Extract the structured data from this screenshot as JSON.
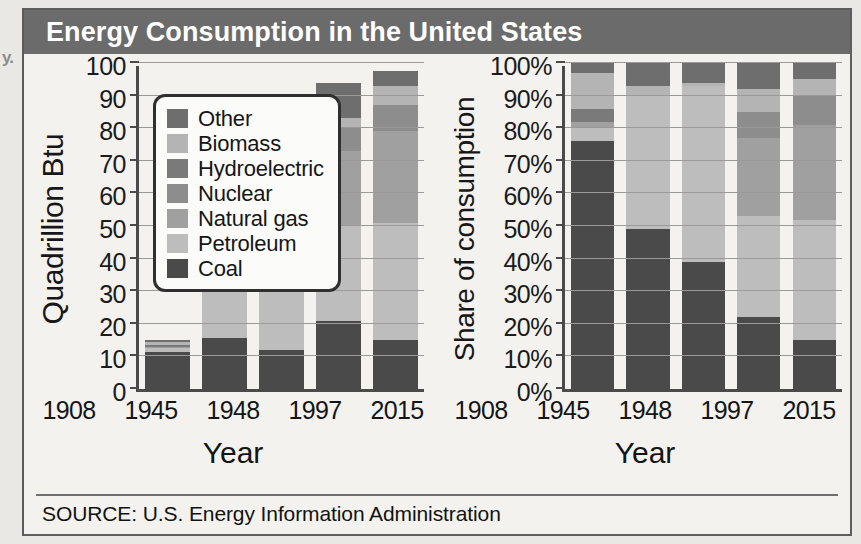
{
  "page_artifact": "y.",
  "figure": {
    "title": "Energy Consumption in the United States",
    "source": "SOURCE: U.S. Energy Information Administration",
    "title_bar_color": "#6b6b6b",
    "panel_background": "#f3f2ee"
  },
  "legend": {
    "items": [
      {
        "label": "Other",
        "color": "#6e6e6e"
      },
      {
        "label": "Biomass",
        "color": "#b4b4b4"
      },
      {
        "label": "Hydroelectric",
        "color": "#7a7a7a"
      },
      {
        "label": "Nuclear",
        "color": "#8d8d8d"
      },
      {
        "label": "Natural gas",
        "color": "#a0a0a0"
      },
      {
        "label": "Petroleum",
        "color": "#bdbdbd"
      },
      {
        "label": "Coal",
        "color": "#4a4a4a"
      }
    ]
  },
  "chart_data": [
    {
      "type": "bar",
      "stacked": true,
      "id": "quadrillion-btu",
      "title": "Energy Consumption in the United States",
      "xlabel": "Year",
      "ylabel": "Quadrillion Btu",
      "categories": [
        "1908",
        "1945",
        "1948",
        "1997",
        "2015"
      ],
      "ylim": [
        0,
        100
      ],
      "yticks": [
        0,
        10,
        20,
        30,
        40,
        50,
        60,
        70,
        80,
        90,
        100
      ],
      "ytick_labels": [
        "0",
        "10",
        "20",
        "30",
        "40",
        "50",
        "60",
        "70",
        "80",
        "90",
        "100"
      ],
      "grid": true,
      "legend_position": "inside-upper-left",
      "series": [
        {
          "name": "Coal",
          "color": "#4a4a4a",
          "values": [
            11.5,
            15.5,
            12.0,
            21.0,
            15.0
          ]
        },
        {
          "name": "Petroleum",
          "color": "#bdbdbd",
          "values": [
            1.0,
            15.5,
            18.0,
            29.0,
            36.0
          ]
        },
        {
          "name": "Natural gas",
          "color": "#a0a0a0",
          "values": [
            0.4,
            0.0,
            0.0,
            23.0,
            28.0
          ]
        },
        {
          "name": "Nuclear",
          "color": "#8d8d8d",
          "values": [
            0.0,
            0.0,
            0.0,
            7.0,
            8.0
          ]
        },
        {
          "name": "Hydroelectric",
          "color": "#7a7a7a",
          "values": [
            0.5,
            0.0,
            0.0,
            0.0,
            0.0
          ]
        },
        {
          "name": "Biomass",
          "color": "#b4b4b4",
          "values": [
            0.9,
            0.4,
            0.5,
            3.0,
            6.0
          ]
        },
        {
          "name": "Other",
          "color": "#6e6e6e",
          "values": [
            0.7,
            0.6,
            1.5,
            11.0,
            4.5
          ]
        }
      ],
      "totals": [
        15.0,
        32.0,
        32.0,
        94.0,
        97.5
      ]
    },
    {
      "type": "bar",
      "stacked": true,
      "id": "share-of-consumption",
      "title": "Energy Consumption in the United States",
      "xlabel": "Year",
      "ylabel": "Share of consumption",
      "categories": [
        "1908",
        "1945",
        "1948",
        "1997",
        "2015"
      ],
      "ylim": [
        0,
        100
      ],
      "yticks": [
        0,
        10,
        20,
        30,
        40,
        50,
        60,
        70,
        80,
        90,
        100
      ],
      "ytick_labels": [
        "0%",
        "10%",
        "20%",
        "30%",
        "40%",
        "50%",
        "60%",
        "70%",
        "80%",
        "90%",
        "100%"
      ],
      "grid": true,
      "legend_position": "none",
      "series": [
        {
          "name": "Coal",
          "color": "#4a4a4a",
          "values": [
            76.0,
            49.0,
            39.0,
            22.0,
            15.0
          ]
        },
        {
          "name": "Petroleum",
          "color": "#bdbdbd",
          "values": [
            4.0,
            41.0,
            54.0,
            31.0,
            37.0
          ]
        },
        {
          "name": "Natural gas",
          "color": "#a0a0a0",
          "values": [
            2.0,
            0.0,
            0.0,
            24.0,
            29.0
          ]
        },
        {
          "name": "Nuclear",
          "color": "#8d8d8d",
          "values": [
            0.0,
            0.0,
            0.0,
            8.0,
            9.0
          ]
        },
        {
          "name": "Hydroelectric",
          "color": "#7a7a7a",
          "values": [
            4.0,
            0.0,
            0.0,
            0.0,
            0.0
          ]
        },
        {
          "name": "Biomass",
          "color": "#b4b4b4",
          "values": [
            11.0,
            3.0,
            1.0,
            7.0,
            5.0
          ]
        },
        {
          "name": "Other",
          "color": "#6e6e6e",
          "values": [
            3.0,
            7.0,
            6.0,
            8.0,
            5.0
          ]
        }
      ],
      "totals": [
        100,
        100,
        100,
        100,
        100
      ]
    }
  ]
}
